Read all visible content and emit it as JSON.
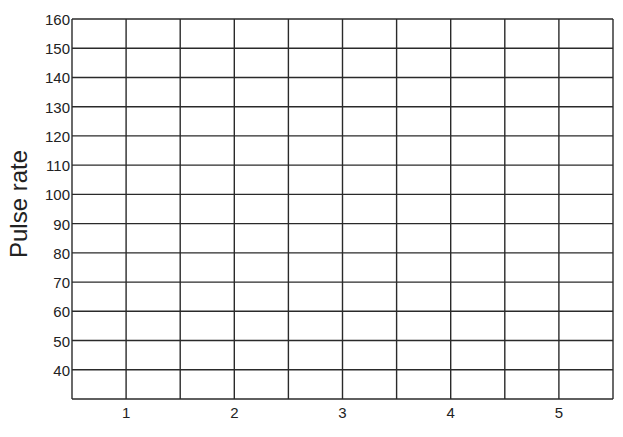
{
  "chart_data": {
    "type": "line",
    "title": "",
    "xlabel": "",
    "ylabel": "Pulse rate",
    "x_ticks": [
      "1",
      "2",
      "3",
      "4",
      "5"
    ],
    "y_ticks": [
      "160",
      "150",
      "140",
      "130",
      "120",
      "110",
      "100",
      "90",
      "80",
      "70",
      "60",
      "50",
      "40"
    ],
    "ylim": [
      30,
      160
    ],
    "xlim": [
      0.5,
      5.5
    ],
    "grid": true,
    "grid_columns": 10,
    "grid_rows": 13,
    "series": [],
    "note": "Blank grid for plotting; no data points drawn"
  }
}
